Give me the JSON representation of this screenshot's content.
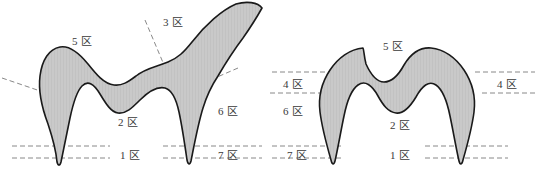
{
  "figure": {
    "title": "",
    "background_color": "#ffffff",
    "shape_fill_color": "#c8c8c8",
    "shape_stroke_color": "#1a1a1a",
    "dashed_line_color": "#7a7a7a",
    "label_color": "#3a3a3a"
  },
  "panels": [
    {
      "id": "left-tooth-diagram",
      "name": "molar-cross-section-with-branch",
      "labels": [
        {
          "id": "left-zone-5",
          "text": "5 区",
          "x": 72,
          "y": 36
        },
        {
          "id": "left-zone-3",
          "text": "3 区",
          "x": 163,
          "y": 17
        },
        {
          "id": "left-zone-2",
          "text": "2 区",
          "x": 118,
          "y": 117
        },
        {
          "id": "left-zone-6",
          "text": "6 区",
          "x": 218,
          "y": 106
        },
        {
          "id": "left-zone-1",
          "text": "1 区",
          "x": 120,
          "y": 150
        },
        {
          "id": "left-zone-7",
          "text": "7 区",
          "x": 218,
          "y": 150
        }
      ],
      "dashed_guides": [
        {
          "id": "left-guide-upper-horizontal-a",
          "kind": "horizontal"
        },
        {
          "id": "left-guide-upper-horizontal-b",
          "kind": "horizontal"
        },
        {
          "id": "left-guide-lower-horizontal-a",
          "kind": "horizontal"
        },
        {
          "id": "left-guide-lower-horizontal-b",
          "kind": "horizontal"
        },
        {
          "id": "left-guide-diagonal-west",
          "kind": "diagonal"
        },
        {
          "id": "left-guide-diagonal-north",
          "kind": "diagonal"
        },
        {
          "id": "left-guide-diagonal-east",
          "kind": "diagonal"
        }
      ]
    },
    {
      "id": "right-tooth-diagram",
      "name": "molar-cross-section",
      "labels": [
        {
          "id": "right-zone-5",
          "text": "5 区",
          "x": 113,
          "y": 41
        },
        {
          "id": "right-zone-4-left",
          "text": "4 区",
          "x": 13,
          "y": 79
        },
        {
          "id": "right-zone-4-right",
          "text": "4 区",
          "x": 227,
          "y": 79
        },
        {
          "id": "right-zone-6",
          "text": "6 区",
          "x": 13,
          "y": 106
        },
        {
          "id": "right-zone-2",
          "text": "2 区",
          "x": 120,
          "y": 120
        },
        {
          "id": "right-zone-7",
          "text": "7 区",
          "x": 17,
          "y": 150
        },
        {
          "id": "right-zone-1",
          "text": "1 区",
          "x": 120,
          "y": 150
        }
      ],
      "dashed_guides": [
        {
          "id": "right-guide-4-top-left",
          "kind": "horizontal"
        },
        {
          "id": "right-guide-4-bottom-left",
          "kind": "horizontal"
        },
        {
          "id": "right-guide-4-top-right",
          "kind": "horizontal"
        },
        {
          "id": "right-guide-4-bottom-right",
          "kind": "horizontal"
        },
        {
          "id": "right-guide-7-top",
          "kind": "horizontal"
        },
        {
          "id": "right-guide-7-bottom",
          "kind": "horizontal"
        },
        {
          "id": "right-guide-1-top",
          "kind": "horizontal"
        },
        {
          "id": "right-guide-1-bottom",
          "kind": "horizontal"
        }
      ]
    }
  ]
}
